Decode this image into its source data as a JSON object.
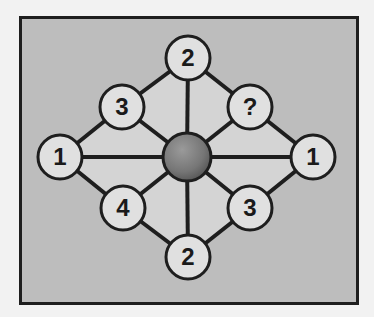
{
  "puzzle": {
    "type": "number-circle-diagram",
    "colors": {
      "background": "#f2f2f2",
      "frame_fill": "#bdbdbd",
      "frame_border": "#1e1e1e",
      "inner_fill": "#d4d4d4",
      "node_fill": "#e0e0e0",
      "line": "#1e1e1e",
      "center_fill": "#7a7a7a"
    },
    "center": {
      "x": 187,
      "y": 157,
      "r": 24
    },
    "nodes": [
      {
        "id": "top",
        "label": "2",
        "x": 188,
        "y": 58
      },
      {
        "id": "upper-left",
        "label": "3",
        "x": 122,
        "y": 107
      },
      {
        "id": "upper-right",
        "label": "?",
        "x": 250,
        "y": 107
      },
      {
        "id": "left",
        "label": "1",
        "x": 60,
        "y": 157
      },
      {
        "id": "right",
        "label": "1",
        "x": 313,
        "y": 157
      },
      {
        "id": "lower-left",
        "label": "4",
        "x": 123,
        "y": 208
      },
      {
        "id": "lower-right",
        "label": "3",
        "x": 250,
        "y": 208
      },
      {
        "id": "bottom",
        "label": "2",
        "x": 188,
        "y": 257
      }
    ],
    "node_radius": 22
  }
}
